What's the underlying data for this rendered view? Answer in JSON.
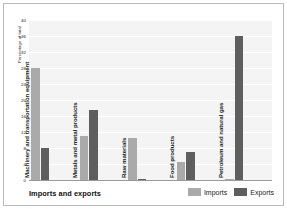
{
  "chart_data": {
    "type": "bar",
    "title": "Imports and exports",
    "xlabel": "",
    "ylabel": "Percentage of total",
    "ylim": [
      0,
      40
    ],
    "yticks": [
      0,
      4,
      8,
      12,
      16,
      20,
      24,
      28,
      32,
      36,
      40
    ],
    "grid": true,
    "legend_position": "bottom-right",
    "categories": [
      "Machinery and transportation equipment",
      "Metals and metal products",
      "Raw materials",
      "Food products",
      "Petroleum and natural gas"
    ],
    "series": [
      {
        "name": "Imports",
        "color": "#aaaaaa",
        "values": [
          28,
          11,
          10.5,
          4.5,
          0.2
        ]
      },
      {
        "name": "Exports",
        "color": "#5e5e5e",
        "values": [
          8,
          17.5,
          0.3,
          7,
          36
        ]
      }
    ]
  },
  "legend": {
    "items": [
      {
        "label": "Imports"
      },
      {
        "label": "Exports"
      }
    ]
  }
}
